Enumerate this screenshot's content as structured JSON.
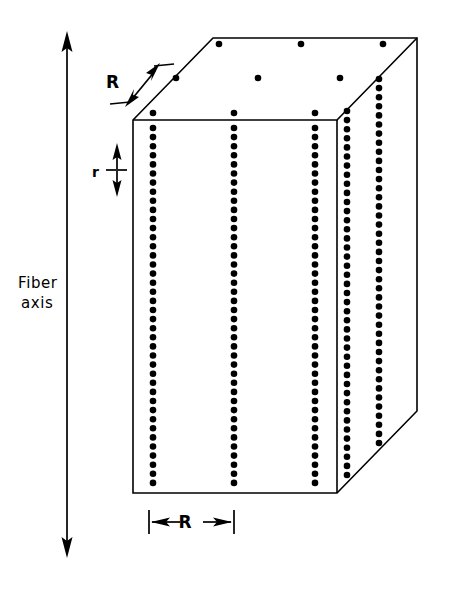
{
  "figure": {
    "type": "3d-block-diagram",
    "background_color": "#ffffff",
    "ink_color": "#000000",
    "canvas": {
      "width": 449,
      "height": 590
    }
  },
  "labels": {
    "fiber_axis_line1": "Fiber",
    "fiber_axis_line2": "axis",
    "lateral_spacing_top": "R",
    "lateral_spacing_bottom": "R",
    "axial_spacing": "r"
  },
  "annotations": [
    {
      "name": "fiber-axis-arrow",
      "label": "Fiber axis",
      "orientation": "vertical",
      "arrowheads": "both",
      "x": 67,
      "y_top": 33,
      "y_bottom": 556
    },
    {
      "name": "R-top-dimension",
      "label": "R",
      "orientation": "diagonal",
      "arrowheads": "both",
      "description": "lateral microfibril spacing measured along the top-left receding edge"
    },
    {
      "name": "r-axial-dimension",
      "label": "r",
      "orientation": "vertical",
      "arrowheads": "both",
      "description": "axial repeat distance between successive scattering centers along a column"
    },
    {
      "name": "R-bottom-dimension",
      "label": "R",
      "orientation": "horizontal",
      "arrowheads": "both",
      "description": "lateral microfibril spacing across the front face"
    }
  ],
  "geometry": {
    "front_face": {
      "top_left": [
        133,
        120
      ],
      "top_right": [
        337,
        120
      ],
      "bottom_right": [
        337,
        493
      ],
      "bottom_left": [
        133,
        493
      ]
    },
    "top_face": {
      "front_left": [
        133,
        120
      ],
      "back_left": [
        213,
        38
      ],
      "back_right": [
        417,
        38
      ],
      "front_right": [
        337,
        120
      ]
    },
    "right_face": {
      "front_top": [
        337,
        120
      ],
      "back_top": [
        417,
        38
      ],
      "back_bottom": [
        417,
        411
      ],
      "front_bottom": [
        337,
        493
      ]
    }
  },
  "lattice": {
    "dot_radius": 3.3,
    "axial_pitch": 9.1,
    "front_columns_x": [
      153,
      234,
      315
    ],
    "front_column_top_y": 128,
    "front_column_bottom_y": 487,
    "right_columns": [
      {
        "x": 347,
        "top_y": 111,
        "bottom_y": 483
      },
      {
        "x": 379,
        "top_y": 79,
        "bottom_y": 451
      }
    ],
    "top_face_rows": [
      {
        "y": 44,
        "xs": [
          219,
          301,
          383
        ]
      },
      {
        "y": 78,
        "xs": [
          176,
          258,
          340
        ]
      },
      {
        "y": 113,
        "xs": [
          153,
          234,
          315
        ]
      }
    ]
  },
  "chart_data": {
    "type": "scatter",
    "xlabel": "lateral position",
    "ylabel": "position along fiber axis",
    "parameters": [
      {
        "symbol": "R",
        "meaning": "lateral spacing between microfibril columns"
      },
      {
        "symbol": "r",
        "meaning": "axial spacing between scattering centers along a column"
      }
    ],
    "counts": {
      "front_face_columns": 3,
      "right_face_columns": 2,
      "top_face_dot_rows": 3,
      "top_face_dots_per_row": 3,
      "dots_per_front_column": 41
    }
  }
}
